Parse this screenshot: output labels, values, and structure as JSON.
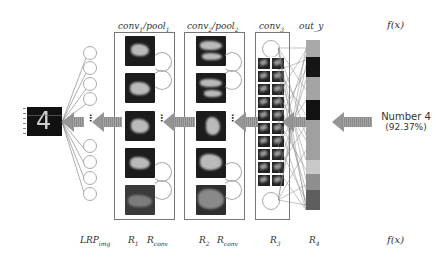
{
  "diagram": {
    "type": "LRP (layer-wise relevance propagation) through a CNN on MNIST digit",
    "top_labels": {
      "conv1": {
        "base": "conv",
        "sub1": "1",
        "sep": "/",
        "base2": "pool",
        "sub2": "1"
      },
      "conv2": {
        "base": "conv",
        "sub1": "2",
        "sep": "/",
        "base2": "pool",
        "sub2": "2"
      },
      "conv3": {
        "base": "conv",
        "sub": "3"
      },
      "out": "out_y",
      "fx": "f(x)"
    },
    "bottom_labels": {
      "lrp_img": {
        "base": "LRP",
        "sub": "img"
      },
      "r1": {
        "base": "R",
        "sub": "1"
      },
      "rconv1": {
        "base": "R",
        "sub": "conv"
      },
      "r2": {
        "base": "R",
        "sub": "2"
      },
      "rconv2": {
        "base": "R",
        "sub": "conv"
      },
      "r3": {
        "base": "R",
        "sub": "3"
      },
      "r4": {
        "base": "R",
        "sub": "4"
      },
      "fx": "f(x)"
    },
    "input_image": {
      "digit": "4"
    },
    "prediction": {
      "line1": "Number 4",
      "line2": "(92.37%)"
    },
    "ellipsis": "⋮",
    "out_y_segments": [
      {
        "height": 17,
        "color": "#a9a9a9"
      },
      {
        "height": 20,
        "color": "#151515"
      },
      {
        "height": 23,
        "color": "#a4a4a4"
      },
      {
        "height": 20,
        "color": "#121212"
      },
      {
        "height": 40,
        "color": "#a0a0a0"
      },
      {
        "height": 14,
        "color": "#c8c8c8"
      },
      {
        "height": 16,
        "color": "#8e8e8e"
      },
      {
        "height": 20,
        "color": "#5e5e5e"
      }
    ],
    "colors": {
      "arrow": "#959595",
      "box_border": "#777777",
      "feature_map_bg": "#1c1c1c",
      "neuron_border": "#aaaaaa"
    }
  }
}
